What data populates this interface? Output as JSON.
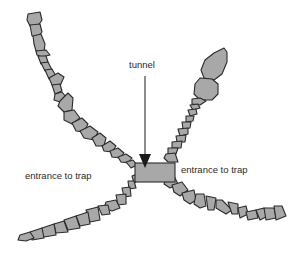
{
  "diagram": {
    "labels": {
      "tunnel": "tunnel",
      "entrance_left": "entrance to trap",
      "entrance_right": "entrance to trap"
    },
    "colors": {
      "stone_fill": "#a8a8a8",
      "stone_outline": "#2a2a2a",
      "tunnel_fill": "#a8a8a8",
      "arrow": "#1a1a1a",
      "background": "#ffffff"
    },
    "components": [
      "upper-left stone wall",
      "upper-right stone wall",
      "lower-left stone wall",
      "lower-right stone wall",
      "tunnel box",
      "tunnel arrow"
    ]
  }
}
